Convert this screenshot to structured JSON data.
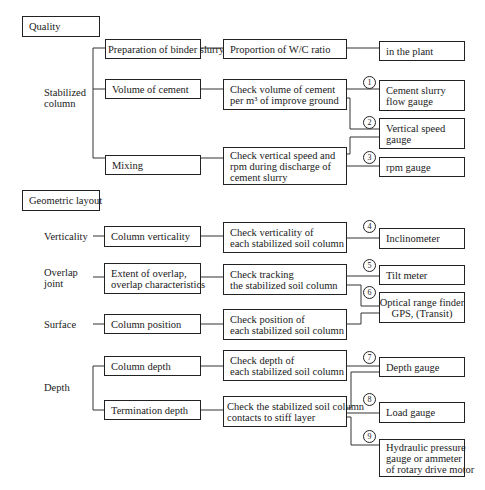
{
  "sections": {
    "quality": "Quality",
    "geometric": "Geometric layout"
  },
  "categories": {
    "stabilized_column": [
      "Stabilized",
      "column"
    ],
    "verticality": "Verticality",
    "overlap_joint": [
      "Overlap",
      "joint"
    ],
    "surface": "Surface",
    "depth": "Depth"
  },
  "items": {
    "binder_slurry": "Preparation of binder slurry",
    "volume_cement": "Volume of cement",
    "mixing": "Mixing",
    "column_verticality": "Column verticality",
    "overlap": [
      "Extent of overlap,",
      "overlap characteristics"
    ],
    "column_position": "Column position",
    "column_depth": "Column depth",
    "termination_depth": "Termination depth"
  },
  "checks": {
    "wc_ratio": "Proportion of W/C ratio",
    "volume": [
      "Check volume of cement",
      "per m³ of improve ground"
    ],
    "vertical_speed": [
      "Check vertical speed and",
      "rpm during discharge of",
      "cement slurry"
    ],
    "verticality": [
      "Check verticality of",
      "each stabilized soil column"
    ],
    "tracking": [
      "Check tracking",
      "the stabilized soil column"
    ],
    "position": [
      "Check position of",
      "each stabilized soil column"
    ],
    "depth": [
      "Check depth of",
      "each stabilized soil column"
    ],
    "stiff_layer": [
      "Check the stabilized soil column",
      "contacts to stiff layer"
    ]
  },
  "devices": {
    "plant": "in the plant",
    "flow_gauge": [
      "Cement slurry",
      "flow gauge"
    ],
    "speed_gauge": [
      "Vertical speed",
      "gauge"
    ],
    "rpm_gauge": "rpm gauge",
    "inclinometer": "Inclinometer",
    "tilt_meter": "Tilt meter",
    "optical": [
      "Optical range finder",
      "GPS, (Transit)"
    ],
    "depth_gauge": "Depth gauge",
    "load_gauge": "Load gauge",
    "hydraulic": [
      "Hydraulic pressure",
      "gauge or ammeter",
      "of rotary drive motor"
    ]
  },
  "numbers": [
    "1",
    "2",
    "3",
    "4",
    "5",
    "6",
    "7",
    "8",
    "9"
  ]
}
